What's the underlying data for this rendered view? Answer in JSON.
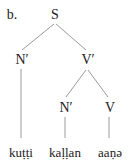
{
  "example_label": "b.",
  "tree": {
    "root": "S",
    "left_child": "N′",
    "right_child": "V′",
    "right_left_child": "N′",
    "right_right_child": "V"
  },
  "words": [
    "kuṭṭi",
    "kaḷḷan",
    "aaṇə"
  ],
  "line_color": "#999999"
}
